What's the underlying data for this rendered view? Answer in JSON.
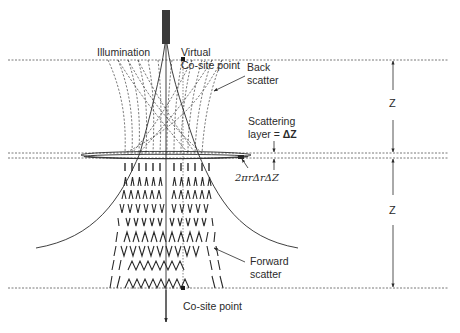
{
  "labels": {
    "illumination": "Illumination",
    "virtual_line1": "Virtual",
    "virtual_line2": "Co-site point",
    "back_line1": "Back",
    "back_line2": "scatter",
    "scattering_line1": "Scattering",
    "scattering_line2_prefix": "layer = ",
    "scattering_line2_value": "ΔZ",
    "annulus": "2πrΔrΔZ",
    "forward_line1": "Forward",
    "forward_line2": "scatter",
    "cosite": "Co-site point",
    "z_upper": "Z",
    "z_lower": "Z"
  },
  "colors": {
    "ink": "#2a2a2a",
    "dotted": "#555555",
    "source": "#3a3a3a"
  },
  "geometry": {
    "top_plane_y": 60,
    "layer_top_y": 153,
    "layer_bottom_y": 158,
    "bottom_plane_y": 288,
    "axis_x": 166,
    "virtual_point": [
      183,
      59
    ],
    "cosite_point": [
      183,
      289
    ],
    "dim_x": 393
  }
}
